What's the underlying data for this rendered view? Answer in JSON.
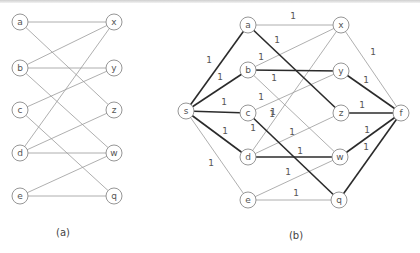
{
  "figure_a": {
    "caption": "(a)",
    "nodes": [
      {
        "id": "a",
        "label": "a",
        "x": 20,
        "y": 22
      },
      {
        "id": "b",
        "label": "b",
        "x": 20,
        "y": 68
      },
      {
        "id": "c",
        "label": "c",
        "x": 20,
        "y": 110
      },
      {
        "id": "d",
        "label": "d",
        "x": 20,
        "y": 153
      },
      {
        "id": "e",
        "label": "e",
        "x": 20,
        "y": 196
      },
      {
        "id": "x",
        "label": "x",
        "x": 114,
        "y": 22
      },
      {
        "id": "y",
        "label": "y",
        "x": 114,
        "y": 68
      },
      {
        "id": "z",
        "label": "z",
        "x": 114,
        "y": 110
      },
      {
        "id": "w",
        "label": "w",
        "x": 114,
        "y": 153
      },
      {
        "id": "q",
        "label": "q",
        "x": 114,
        "y": 196
      }
    ],
    "edges": [
      [
        "a",
        "x"
      ],
      [
        "a",
        "z"
      ],
      [
        "b",
        "x"
      ],
      [
        "b",
        "y"
      ],
      [
        "b",
        "w"
      ],
      [
        "c",
        "y"
      ],
      [
        "c",
        "q"
      ],
      [
        "d",
        "x"
      ],
      [
        "d",
        "z"
      ],
      [
        "d",
        "w"
      ],
      [
        "e",
        "w"
      ],
      [
        "e",
        "q"
      ]
    ]
  },
  "figure_b": {
    "caption": "(b)",
    "nodes": [
      {
        "id": "s",
        "label": "s",
        "x": 186,
        "y": 111
      },
      {
        "id": "a",
        "label": "a",
        "x": 248,
        "y": 25
      },
      {
        "id": "b",
        "label": "b",
        "x": 248,
        "y": 70
      },
      {
        "id": "c",
        "label": "c",
        "x": 248,
        "y": 113
      },
      {
        "id": "d",
        "label": "d",
        "x": 248,
        "y": 157
      },
      {
        "id": "e",
        "label": "e",
        "x": 248,
        "y": 200
      },
      {
        "id": "x",
        "label": "x",
        "x": 341,
        "y": 25
      },
      {
        "id": "y",
        "label": "y",
        "x": 341,
        "y": 71
      },
      {
        "id": "z",
        "label": "z",
        "x": 341,
        "y": 113
      },
      {
        "id": "w",
        "label": "w",
        "x": 340,
        "y": 157
      },
      {
        "id": "q",
        "label": "q",
        "x": 339,
        "y": 200
      },
      {
        "id": "f",
        "label": "f",
        "x": 401,
        "y": 113
      }
    ],
    "edges": [
      {
        "from": "s",
        "to": "a",
        "weight": "1",
        "bold": true,
        "lx": 209,
        "ly": 60
      },
      {
        "from": "s",
        "to": "b",
        "weight": "1",
        "bold": true,
        "lx": 220,
        "ly": 77
      },
      {
        "from": "s",
        "to": "c",
        "weight": "1",
        "bold": true,
        "lx": 224,
        "ly": 102
      },
      {
        "from": "s",
        "to": "d",
        "weight": "1",
        "bold": true,
        "lx": 225,
        "ly": 131
      },
      {
        "from": "s",
        "to": "e",
        "weight": "1",
        "bold": false,
        "lx": 211,
        "ly": 163
      },
      {
        "from": "a",
        "to": "x",
        "weight": "1",
        "bold": false,
        "lx": 293,
        "ly": 16
      },
      {
        "from": "a",
        "to": "z",
        "weight": "1",
        "bold": true,
        "lx": 277,
        "ly": 40
      },
      {
        "from": "b",
        "to": "x",
        "weight": "1",
        "bold": false,
        "lx": 261,
        "ly": 57
      },
      {
        "from": "b",
        "to": "y",
        "weight": "1",
        "bold": true,
        "lx": 274,
        "ly": 78
      },
      {
        "from": "b",
        "to": "w",
        "weight": "1",
        "bold": false,
        "lx": 273,
        "ly": 112
      },
      {
        "from": "c",
        "to": "y",
        "weight": "1",
        "bold": false,
        "lx": 261,
        "ly": 97
      },
      {
        "from": "c",
        "to": "q",
        "weight": "1",
        "bold": true,
        "lx": 253,
        "ly": 128
      },
      {
        "from": "d",
        "to": "x",
        "weight": "1",
        "bold": false,
        "lx": 272,
        "ly": 114
      },
      {
        "from": "d",
        "to": "z",
        "weight": "1",
        "bold": false,
        "lx": 292,
        "ly": 132
      },
      {
        "from": "d",
        "to": "w",
        "weight": "1",
        "bold": true,
        "lx": 300,
        "ly": 151
      },
      {
        "from": "e",
        "to": "w",
        "weight": "1",
        "bold": false,
        "lx": 288,
        "ly": 172
      },
      {
        "from": "e",
        "to": "q",
        "weight": "1",
        "bold": false,
        "lx": 296,
        "ly": 193
      },
      {
        "from": "x",
        "to": "f",
        "weight": "1",
        "bold": false,
        "lx": 373,
        "ly": 52
      },
      {
        "from": "y",
        "to": "f",
        "weight": "1",
        "bold": true,
        "lx": 366,
        "ly": 80
      },
      {
        "from": "z",
        "to": "f",
        "weight": "1",
        "bold": true,
        "lx": 362,
        "ly": 105
      },
      {
        "from": "w",
        "to": "f",
        "weight": "1",
        "bold": true,
        "lx": 367,
        "ly": 130
      },
      {
        "from": "q",
        "to": "f",
        "weight": "1",
        "bold": true,
        "lx": 366,
        "ly": 147
      }
    ]
  },
  "captions": {
    "a": "(a)",
    "b": "(b)"
  }
}
